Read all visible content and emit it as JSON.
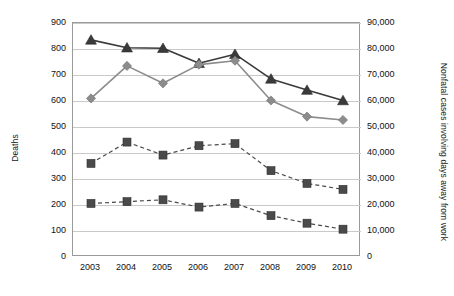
{
  "chart_data": {
    "type": "line",
    "title": "",
    "subtitle": "",
    "xlabel": "",
    "ylabel": "Deaths",
    "ylabel_right": "Nonfatal cases involving days away from work",
    "categories": [
      "2003",
      "2004",
      "2005",
      "2006",
      "2007",
      "2008",
      "2009",
      "2010"
    ],
    "x": [
      2003,
      2004,
      2005,
      2006,
      2007,
      2008,
      2009,
      2010
    ],
    "ylim": [
      0,
      900
    ],
    "ylim_right": [
      0,
      90000
    ],
    "ytick_labels": [
      "0",
      "100",
      "200",
      "300",
      "400",
      "500",
      "600",
      "700",
      "800",
      "900"
    ],
    "ytick_values": [
      0,
      100,
      200,
      300,
      400,
      500,
      600,
      700,
      800,
      900
    ],
    "ytick_right_labels": [
      "0",
      "10,000",
      "20,000",
      "30,000",
      "40,000",
      "50,000",
      "60,000",
      "70,000",
      "80,000",
      "90,000"
    ],
    "ytick_right_values": [
      0,
      10000,
      20000,
      30000,
      40000,
      50000,
      60000,
      70000,
      80000,
      90000
    ],
    "grid": true,
    "grid_axis": "y",
    "legend": "none",
    "series": [
      {
        "name": "Deaths - series A",
        "axis": "left",
        "marker": "triangle",
        "linestyle": "solid",
        "color": "#3a3a3a",
        "values": [
          835,
          805,
          803,
          745,
          780,
          685,
          642,
          602
        ]
      },
      {
        "name": "Deaths - series B",
        "axis": "left",
        "marker": "diamond",
        "linestyle": "solid",
        "color": "#8c8c8c",
        "values": [
          610,
          735,
          668,
          740,
          755,
          602,
          540,
          527
        ]
      },
      {
        "name": "Nonfatal cases - series C",
        "axis": "right",
        "marker": "square",
        "linestyle": "dashed",
        "color": "#4a4a4a",
        "values": [
          36000,
          44200,
          39200,
          42800,
          43600,
          33200,
          28300,
          26000
        ]
      },
      {
        "name": "Nonfatal cases - series D",
        "axis": "right",
        "marker": "square",
        "linestyle": "dashed",
        "color": "#4a4a4a",
        "values": [
          20600,
          21300,
          22000,
          19200,
          20600,
          15900,
          13000,
          10700
        ]
      }
    ]
  },
  "colors": {
    "series_a": "#3a3a3a",
    "series_b": "#8c8c8c",
    "series_c": "#4a4a4a",
    "series_d": "#4a4a4a",
    "grid": "#c9c9c9",
    "frame": "#9a9a9a",
    "text": "#111111",
    "background": "#ffffff"
  },
  "layout": {
    "plot_left": 72,
    "plot_top": 22,
    "plot_width": 288,
    "plot_height": 234
  }
}
